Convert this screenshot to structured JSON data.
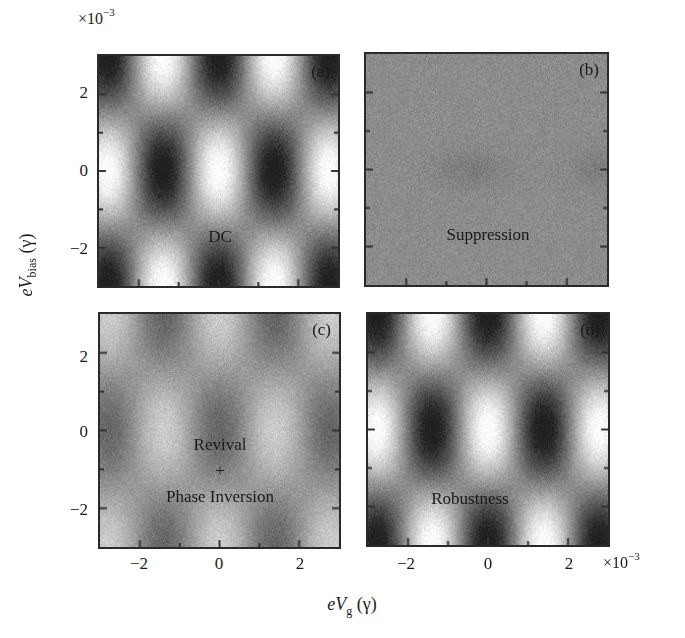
{
  "figure": {
    "y_exponent": "×10",
    "y_exponent_power": "−3",
    "x_exponent": "×10",
    "x_exponent_power": "−3",
    "ylabel_prefix": "eV",
    "ylabel_sub": "bias",
    "ylabel_unit": " (γ)",
    "xlabel_prefix": "eV",
    "xlabel_sub": "g",
    "xlabel_unit": " (γ)",
    "yticks": [
      "2",
      "0",
      "−2"
    ],
    "xticks": [
      "−2",
      "0",
      "2"
    ]
  },
  "panels": [
    {
      "tag": "(a)",
      "label_lines": [
        "DC"
      ]
    },
    {
      "tag": "(b)",
      "label_lines": [
        "Suppression"
      ]
    },
    {
      "tag": "(c)",
      "label_lines": [
        "Revival",
        "+",
        "Phase Inversion"
      ]
    },
    {
      "tag": "(d)",
      "label_lines": [
        "Robustness"
      ]
    }
  ],
  "chart_data": {
    "type": "heatmap",
    "title": "",
    "xlabel": "eV_g (γ)",
    "ylabel": "eV_bias (γ)",
    "x_scale": "×10^-3",
    "y_scale": "×10^-3",
    "xlim": [
      -3,
      3
    ],
    "ylim": [
      -3,
      3
    ],
    "xticks": [
      -2,
      0,
      2
    ],
    "yticks": [
      -2,
      0,
      2
    ],
    "colormap": "grayscale",
    "grid": false,
    "legend": null,
    "panels": [
      {
        "id": "a",
        "label": "DC",
        "pattern": "checkerboard",
        "period_x": 2.8,
        "period_y": 6.0,
        "phase": 0,
        "contrast": 0.46,
        "offset": 0.55,
        "description": "Bright lobes at x≈±1.4, y≈0; dark at x≈0 and ±3 near y=0; inverted at y≈±3"
      },
      {
        "id": "b",
        "label": "Suppression",
        "pattern": "flat",
        "contrast": 0.04,
        "offset": 0.55,
        "description": "Nearly uniform gray; faint dark smudges near y≈0"
      },
      {
        "id": "c",
        "label": "Revival + Phase Inversion",
        "pattern": "checkerboard",
        "period_x": 2.8,
        "period_y": 6.0,
        "phase": 3.14159,
        "contrast": 0.2,
        "offset": 0.6,
        "description": "Same lattice as (a) but phase-inverted and reduced contrast"
      },
      {
        "id": "d",
        "label": "Robustness",
        "pattern": "checkerboard",
        "period_x": 2.8,
        "period_y": 6.0,
        "phase": 0,
        "contrast": 0.46,
        "offset": 0.55,
        "description": "Same as (a): full contrast pattern recovered"
      }
    ]
  }
}
